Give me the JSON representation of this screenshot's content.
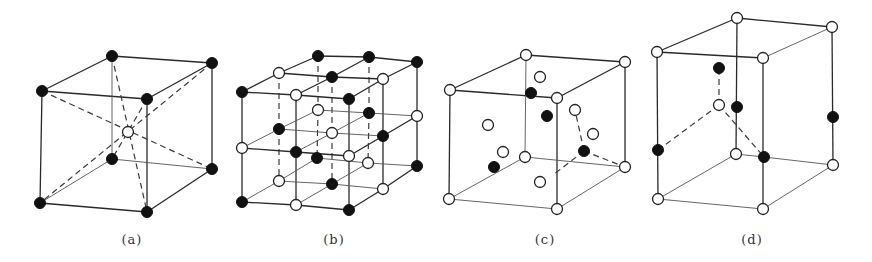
{
  "figure": {
    "panels": [
      {
        "id": "a",
        "label": "(a)",
        "label_pos": [
          132,
          232
        ],
        "atom_radius": 5.5,
        "atoms": [
          {
            "x": 112,
            "y": 56,
            "color": "black"
          },
          {
            "x": 212,
            "y": 63,
            "color": "black"
          },
          {
            "x": 42,
            "y": 91,
            "color": "black"
          },
          {
            "x": 147,
            "y": 99,
            "color": "black"
          },
          {
            "x": 128,
            "y": 132,
            "color": "white"
          },
          {
            "x": 112,
            "y": 159,
            "color": "black"
          },
          {
            "x": 212,
            "y": 169,
            "color": "black"
          },
          {
            "x": 40,
            "y": 203,
            "color": "black"
          },
          {
            "x": 147,
            "y": 212,
            "color": "black"
          }
        ],
        "edges": [
          {
            "from": [
              112,
              56
            ],
            "to": [
              212,
              63
            ],
            "style": "solid"
          },
          {
            "from": [
              42,
              91
            ],
            "to": [
              147,
              99
            ],
            "style": "solid"
          },
          {
            "from": [
              112,
              56
            ],
            "to": [
              42,
              91
            ],
            "style": "solid"
          },
          {
            "from": [
              212,
              63
            ],
            "to": [
              147,
              99
            ],
            "style": "solid"
          },
          {
            "from": [
              42,
              91
            ],
            "to": [
              40,
              203
            ],
            "style": "solid"
          },
          {
            "from": [
              147,
              99
            ],
            "to": [
              147,
              212
            ],
            "style": "solid"
          },
          {
            "from": [
              212,
              63
            ],
            "to": [
              212,
              169
            ],
            "style": "solid"
          },
          {
            "from": [
              40,
              203
            ],
            "to": [
              147,
              212
            ],
            "style": "solid"
          },
          {
            "from": [
              147,
              212
            ],
            "to": [
              212,
              169
            ],
            "style": "solid"
          },
          {
            "from": [
              112,
              56
            ],
            "to": [
              112,
              159
            ],
            "style": "thin"
          },
          {
            "from": [
              112,
              159
            ],
            "to": [
              212,
              169
            ],
            "style": "thin"
          },
          {
            "from": [
              112,
              159
            ],
            "to": [
              40,
              203
            ],
            "style": "thin"
          },
          {
            "from": [
              42,
              91
            ],
            "to": [
              212,
              169
            ],
            "style": "dashed"
          },
          {
            "from": [
              212,
              63
            ],
            "to": [
              40,
              203
            ],
            "style": "dashed"
          },
          {
            "from": [
              112,
              56
            ],
            "to": [
              147,
              212
            ],
            "style": "dashed"
          },
          {
            "from": [
              147,
              99
            ],
            "to": [
              112,
              159
            ],
            "style": "dashed"
          }
        ]
      },
      {
        "id": "b",
        "label": "(b)",
        "label_pos": [
          334,
          232
        ],
        "atom_radius": 5.5,
        "grid": {
          "layers": [
            [
              [
                {
                  "x": 318,
                  "y": 56,
                  "color": "black"
                },
                {
                  "x": 369,
                  "y": 57,
                  "color": "black"
                },
                {
                  "x": 417,
                  "y": 62,
                  "color": "black"
                }
              ],
              [
                {
                  "x": 279,
                  "y": 73,
                  "color": "white"
                },
                {
                  "x": 332,
                  "y": 77,
                  "color": "black"
                },
                {
                  "x": 383,
                  "y": 79,
                  "color": "white"
                }
              ],
              [
                {
                  "x": 242,
                  "y": 92,
                  "color": "black"
                },
                {
                  "x": 296,
                  "y": 95,
                  "color": "white"
                },
                {
                  "x": 349,
                  "y": 99,
                  "color": "black"
                }
              ]
            ],
            [
              [
                {
                  "x": 318,
                  "y": 110,
                  "color": "white"
                },
                {
                  "x": 369,
                  "y": 113,
                  "color": "black"
                },
                {
                  "x": 417,
                  "y": 116,
                  "color": "white"
                }
              ],
              [
                {
                  "x": 279,
                  "y": 129,
                  "color": "black"
                },
                {
                  "x": 332,
                  "y": 133,
                  "color": "white"
                },
                {
                  "x": 383,
                  "y": 136,
                  "color": "black"
                }
              ],
              [
                {
                  "x": 242,
                  "y": 148,
                  "color": "white"
                },
                {
                  "x": 296,
                  "y": 152,
                  "color": "black"
                },
                {
                  "x": 349,
                  "y": 156,
                  "color": "white"
                }
              ]
            ],
            [
              [
                {
                  "x": 317,
                  "y": 158,
                  "color": "black"
                },
                {
                  "x": 368,
                  "y": 163,
                  "color": "white"
                },
                {
                  "x": 417,
                  "y": 166,
                  "color": "black"
                }
              ],
              [
                {
                  "x": 279,
                  "y": 181,
                  "color": "white"
                },
                {
                  "x": 332,
                  "y": 184,
                  "color": "black"
                },
                {
                  "x": 383,
                  "y": 189,
                  "color": "white"
                }
              ],
              [
                {
                  "x": 242,
                  "y": 202,
                  "color": "black"
                },
                {
                  "x": 296,
                  "y": 205,
                  "color": "white"
                },
                {
                  "x": 349,
                  "y": 210,
                  "color": "black"
                }
              ]
            ]
          ]
        }
      },
      {
        "id": "c",
        "label": "(c)",
        "label_pos": [
          545,
          232
        ],
        "atom_radius": 5.5,
        "atoms": [
          {
            "x": 526,
            "y": 55,
            "color": "white"
          },
          {
            "x": 625,
            "y": 62,
            "color": "white"
          },
          {
            "x": 450,
            "y": 90,
            "color": "white"
          },
          {
            "x": 557,
            "y": 98,
            "color": "white"
          },
          {
            "x": 525,
            "y": 157,
            "color": "white"
          },
          {
            "x": 625,
            "y": 167,
            "color": "white"
          },
          {
            "x": 449,
            "y": 199,
            "color": "white"
          },
          {
            "x": 557,
            "y": 209,
            "color": "white"
          },
          {
            "x": 540,
            "y": 77,
            "color": "white"
          },
          {
            "x": 488,
            "y": 125,
            "color": "white"
          },
          {
            "x": 575,
            "y": 110,
            "color": "white"
          },
          {
            "x": 593,
            "y": 134,
            "color": "white"
          },
          {
            "x": 503,
            "y": 152,
            "color": "white"
          },
          {
            "x": 540,
            "y": 182,
            "color": "white"
          },
          {
            "x": 531,
            "y": 93,
            "color": "black"
          },
          {
            "x": 547,
            "y": 116,
            "color": "black"
          },
          {
            "x": 584,
            "y": 151,
            "color": "black"
          },
          {
            "x": 494,
            "y": 167,
            "color": "black"
          }
        ],
        "edges": [
          {
            "from": [
              526,
              55
            ],
            "to": [
              625,
              62
            ],
            "style": "solid"
          },
          {
            "from": [
              450,
              90
            ],
            "to": [
              557,
              98
            ],
            "style": "solid"
          },
          {
            "from": [
              526,
              55
            ],
            "to": [
              450,
              90
            ],
            "style": "solid"
          },
          {
            "from": [
              625,
              62
            ],
            "to": [
              557,
              98
            ],
            "style": "solid"
          },
          {
            "from": [
              450,
              90
            ],
            "to": [
              449,
              199
            ],
            "style": "solid"
          },
          {
            "from": [
              557,
              98
            ],
            "to": [
              557,
              209
            ],
            "style": "solid"
          },
          {
            "from": [
              625,
              62
            ],
            "to": [
              625,
              167
            ],
            "style": "solid"
          },
          {
            "from": [
              449,
              199
            ],
            "to": [
              557,
              209
            ],
            "style": "thin"
          },
          {
            "from": [
              557,
              209
            ],
            "to": [
              625,
              167
            ],
            "style": "thin"
          },
          {
            "from": [
              526,
              55
            ],
            "to": [
              525,
              157
            ],
            "style": "thin"
          },
          {
            "from": [
              525,
              157
            ],
            "to": [
              625,
              167
            ],
            "style": "thin"
          },
          {
            "from": [
              525,
              157
            ],
            "to": [
              449,
              199
            ],
            "style": "thin"
          },
          {
            "from": [
              584,
              151
            ],
            "to": [
              575,
              110
            ],
            "style": "dashed"
          },
          {
            "from": [
              584,
              151
            ],
            "to": [
              625,
              167
            ],
            "style": "dashed"
          },
          {
            "from": [
              584,
              151
            ],
            "to": [
              553,
              175
            ],
            "style": "dashed"
          }
        ]
      },
      {
        "id": "d",
        "label": "(d)",
        "label_pos": [
          752,
          232
        ],
        "atom_radius": 5.5,
        "atoms": [
          {
            "x": 737,
            "y": 18,
            "color": "white"
          },
          {
            "x": 832,
            "y": 27,
            "color": "white"
          },
          {
            "x": 657,
            "y": 52,
            "color": "white"
          },
          {
            "x": 763,
            "y": 58,
            "color": "white"
          },
          {
            "x": 736,
            "y": 154,
            "color": "white"
          },
          {
            "x": 833,
            "y": 165,
            "color": "white"
          },
          {
            "x": 658,
            "y": 199,
            "color": "white"
          },
          {
            "x": 763,
            "y": 209,
            "color": "white"
          },
          {
            "x": 719,
            "y": 105,
            "color": "white"
          },
          {
            "x": 719,
            "y": 68,
            "color": "black"
          },
          {
            "x": 737,
            "y": 107,
            "color": "black"
          },
          {
            "x": 833,
            "y": 117,
            "color": "black"
          },
          {
            "x": 658,
            "y": 150,
            "color": "black"
          },
          {
            "x": 764,
            "y": 157,
            "color": "black"
          }
        ],
        "edges": [
          {
            "from": [
              737,
              18
            ],
            "to": [
              832,
              27
            ],
            "style": "solid"
          },
          {
            "from": [
              657,
              52
            ],
            "to": [
              763,
              58
            ],
            "style": "solid"
          },
          {
            "from": [
              737,
              18
            ],
            "to": [
              657,
              52
            ],
            "style": "solid"
          },
          {
            "from": [
              832,
              27
            ],
            "to": [
              763,
              58
            ],
            "style": "thin"
          },
          {
            "from": [
              657,
              52
            ],
            "to": [
              658,
              199
            ],
            "style": "solid"
          },
          {
            "from": [
              763,
              58
            ],
            "to": [
              763,
              209
            ],
            "style": "solid"
          },
          {
            "from": [
              832,
              27
            ],
            "to": [
              833,
              165
            ],
            "style": "solid"
          },
          {
            "from": [
              737,
              18
            ],
            "to": [
              736,
              154
            ],
            "style": "solid"
          },
          {
            "from": [
              658,
              199
            ],
            "to": [
              763,
              209
            ],
            "style": "thin"
          },
          {
            "from": [
              763,
              209
            ],
            "to": [
              833,
              165
            ],
            "style": "thin"
          },
          {
            "from": [
              736,
              154
            ],
            "to": [
              658,
              199
            ],
            "style": "thin"
          },
          {
            "from": [
              736,
              154
            ],
            "to": [
              764,
              157
            ],
            "style": "thin"
          },
          {
            "from": [
              764,
              157
            ],
            "to": [
              833,
              165
            ],
            "style": "thin"
          },
          {
            "from": [
              719,
              105
            ],
            "to": [
              719,
              68
            ],
            "style": "dashed"
          },
          {
            "from": [
              719,
              105
            ],
            "to": [
              658,
              150
            ],
            "style": "dashed"
          },
          {
            "from": [
              719,
              105
            ],
            "to": [
              764,
              157
            ],
            "style": "dashed"
          }
        ]
      }
    ]
  }
}
